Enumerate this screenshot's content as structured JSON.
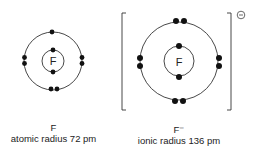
{
  "atom": {
    "symbol": "F",
    "label": "F",
    "caption": "atomic radius 72 pm"
  },
  "ion": {
    "symbol": "F",
    "label": "F⁻",
    "caption": "ionic radius 136 pm",
    "charge": "⊖"
  }
}
